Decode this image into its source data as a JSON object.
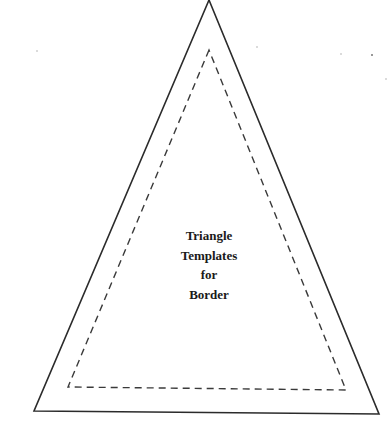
{
  "template": {
    "title_lines": [
      "Triangle",
      "Templates",
      "for",
      "Border"
    ],
    "outer_triangle": {
      "apex": [
        209,
        0
      ],
      "bottom_left": [
        34,
        411
      ],
      "bottom_right": [
        379,
        414
      ],
      "stroke": "#2b2b2b",
      "style": "solid"
    },
    "inner_triangle": {
      "apex": [
        209,
        50
      ],
      "bottom_left": [
        68,
        387
      ],
      "bottom_right": [
        346,
        390
      ],
      "stroke": "#3a3a3a",
      "style": "dashed"
    }
  },
  "colors": {
    "background": "#ffffff",
    "line": "#2b2b2b",
    "text": "#1a1a1a"
  }
}
